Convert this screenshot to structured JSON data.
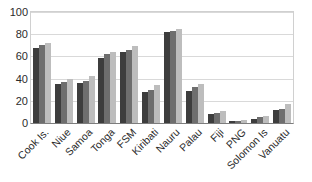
{
  "chart_data": {
    "type": "bar",
    "title": "",
    "xlabel": "",
    "ylabel": "",
    "ylim": [
      0,
      100
    ],
    "yticks": [
      0,
      20,
      40,
      60,
      80,
      100
    ],
    "grid": true,
    "legend": "none",
    "orientation": "vertical",
    "bar_mode": "grouped",
    "categories": [
      "Cook Is.",
      "Niue",
      "Samoa",
      "Tonga",
      "FSM",
      "Kiribati",
      "Nauru",
      "Palau",
      "Fiji",
      "PNG",
      "Solomon Is",
      "Vanuatu"
    ],
    "series": [
      {
        "name": "series-1",
        "color": "#3d3d3d",
        "values": [
          68,
          35,
          36,
          59,
          64,
          28,
          82,
          29,
          8,
          2,
          4,
          12
        ]
      },
      {
        "name": "series-2",
        "color": "#6e6e6e",
        "values": [
          70,
          37,
          38,
          62,
          66,
          30,
          83,
          32,
          9,
          2,
          5,
          13
        ]
      },
      {
        "name": "series-3",
        "color": "#bdbdbd",
        "values": [
          72,
          40,
          42,
          64,
          69,
          34,
          85,
          35,
          11,
          3,
          6,
          17
        ]
      }
    ]
  },
  "axis": {
    "y_tick_labels": [
      "100",
      "80",
      "60",
      "40",
      "20",
      "0"
    ]
  },
  "colors": {
    "series_1": "#3d3d3d",
    "series_2": "#6e6e6e",
    "series_3": "#bdbdbd",
    "grid": "#d9d9d9",
    "axis": "#7d7d7d",
    "text": "#2b2b2b",
    "background": "#ffffff"
  }
}
